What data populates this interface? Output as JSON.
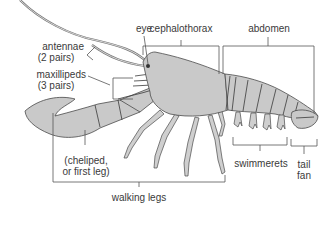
{
  "figure": {
    "colors": {
      "body": "#c9c9c9",
      "outline": "#4a4a4a",
      "text": "#3a3a3a",
      "background": "#ffffff"
    }
  },
  "labels": {
    "eye": "eye",
    "cephalothorax": "cephalothorax",
    "abdomen": "abdomen",
    "antennae": "antennae",
    "antennae_note": "(2 pairs)",
    "maxillipeds": "maxillipeds",
    "maxillipeds_note": "(3 pairs)",
    "cheliped": "(cheliped,",
    "cheliped_note": "or first leg)",
    "walking_legs": "walking legs",
    "swimmerets": "swimmerets",
    "tail": "tail",
    "fan": "fan"
  }
}
